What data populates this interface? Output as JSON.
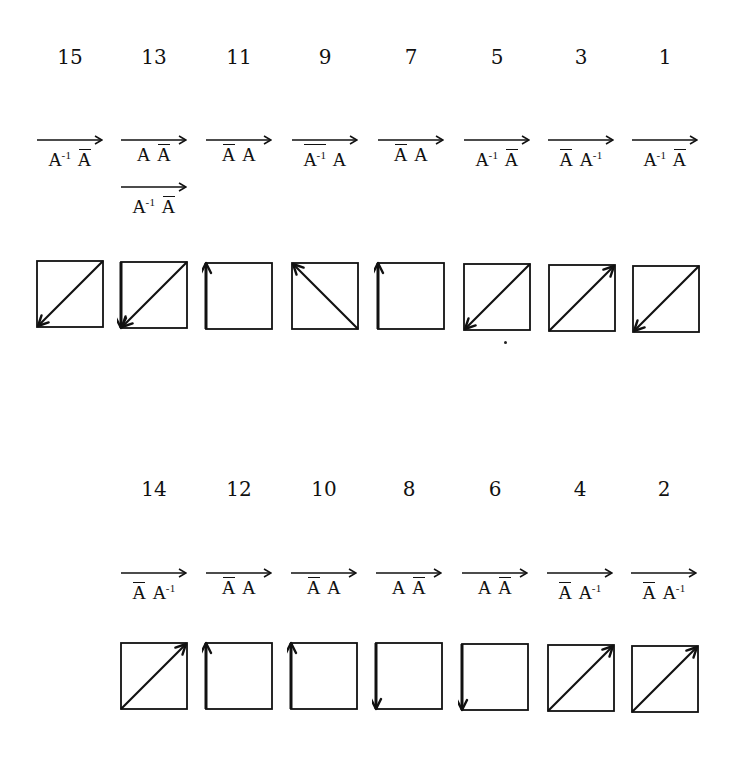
{
  "diagram": {
    "rows": [
      {
        "id": "top",
        "items": [
          {
            "number": "15",
            "labels": [
              [
                {
                  "t": "A",
                  "bar": false,
                  "sup": "-1"
                },
                {
                  "t": "A",
                  "bar": true,
                  "sup": ""
                }
              ]
            ],
            "arrow": "diag-down-left",
            "cx": 70,
            "box": {
              "x": 37,
              "y": 261,
              "s": 66
            }
          },
          {
            "number": "13",
            "labels": [
              [
                {
                  "t": "A",
                  "bar": false,
                  "sup": ""
                },
                {
                  "t": "A",
                  "bar": true,
                  "sup": ""
                }
              ],
              [
                {
                  "t": "A",
                  "bar": false,
                  "sup": "-1"
                },
                {
                  "t": "A",
                  "bar": true,
                  "sup": ""
                }
              ]
            ],
            "arrow": "diag-down-left+left-down",
            "cx": 154,
            "box": {
              "x": 121,
              "y": 262,
              "s": 66
            }
          },
          {
            "number": "11",
            "labels": [
              [
                {
                  "t": "A",
                  "bar": true,
                  "sup": ""
                },
                {
                  "t": "A",
                  "bar": false,
                  "sup": ""
                }
              ]
            ],
            "arrow": "left-up",
            "cx": 239,
            "box": {
              "x": 206,
              "y": 263,
              "s": 66
            }
          },
          {
            "number": "9",
            "labels": [
              [
                {
                  "t": "A",
                  "bar": true,
                  "sup": "-1"
                },
                {
                  "t": "A",
                  "bar": false,
                  "sup": ""
                }
              ]
            ],
            "arrow": "anti-diag-up-left",
            "cx": 325,
            "box": {
              "x": 292,
              "y": 263,
              "s": 66
            }
          },
          {
            "number": "7",
            "labels": [
              [
                {
                  "t": "A",
                  "bar": true,
                  "sup": ""
                },
                {
                  "t": "A",
                  "bar": false,
                  "sup": ""
                }
              ]
            ],
            "arrow": "left-up",
            "cx": 411,
            "box": {
              "x": 378,
              "y": 263,
              "s": 66
            }
          },
          {
            "number": "5",
            "labels": [
              [
                {
                  "t": "A",
                  "bar": false,
                  "sup": "-1"
                },
                {
                  "t": "A",
                  "bar": true,
                  "sup": ""
                }
              ]
            ],
            "arrow": "diag-down-left",
            "cx": 497,
            "box": {
              "x": 464,
              "y": 264,
              "s": 66
            }
          },
          {
            "number": "3",
            "labels": [
              [
                {
                  "t": "A",
                  "bar": true,
                  "sup": ""
                },
                {
                  "t": "A",
                  "bar": false,
                  "sup": "-1"
                }
              ]
            ],
            "arrow": "diag-up-right",
            "cx": 581,
            "box": {
              "x": 549,
              "y": 265,
              "s": 66
            }
          },
          {
            "number": "1",
            "labels": [
              [
                {
                  "t": "A",
                  "bar": false,
                  "sup": "-1"
                },
                {
                  "t": "A",
                  "bar": true,
                  "sup": ""
                }
              ]
            ],
            "arrow": "diag-down-left",
            "cx": 665,
            "box": {
              "x": 633,
              "y": 266,
              "s": 66
            }
          }
        ],
        "number_y": 45,
        "label_y": 135
      },
      {
        "id": "bottom",
        "items": [
          {
            "number": "14",
            "labels": [
              [
                {
                  "t": "A",
                  "bar": true,
                  "sup": ""
                },
                {
                  "t": "A",
                  "bar": false,
                  "sup": "-1"
                }
              ]
            ],
            "arrow": "diag-up-right",
            "cx": 154,
            "box": {
              "x": 121,
              "y": 643,
              "s": 66
            }
          },
          {
            "number": "12",
            "labels": [
              [
                {
                  "t": "A",
                  "bar": true,
                  "sup": ""
                },
                {
                  "t": "A",
                  "bar": false,
                  "sup": ""
                }
              ]
            ],
            "arrow": "left-up",
            "cx": 239,
            "box": {
              "x": 206,
              "y": 643,
              "s": 66
            }
          },
          {
            "number": "10",
            "labels": [
              [
                {
                  "t": "A",
                  "bar": true,
                  "sup": ""
                },
                {
                  "t": "A",
                  "bar": false,
                  "sup": ""
                }
              ]
            ],
            "arrow": "left-up",
            "cx": 324,
            "box": {
              "x": 291,
              "y": 643,
              "s": 66
            }
          },
          {
            "number": "8",
            "labels": [
              [
                {
                  "t": "A",
                  "bar": false,
                  "sup": ""
                },
                {
                  "t": "A",
                  "bar": true,
                  "sup": ""
                }
              ]
            ],
            "arrow": "left-down",
            "cx": 409,
            "box": {
              "x": 376,
              "y": 643,
              "s": 66
            }
          },
          {
            "number": "6",
            "labels": [
              [
                {
                  "t": "A",
                  "bar": false,
                  "sup": ""
                },
                {
                  "t": "A",
                  "bar": true,
                  "sup": ""
                }
              ]
            ],
            "arrow": "left-down",
            "cx": 495,
            "box": {
              "x": 462,
              "y": 644,
              "s": 66
            }
          },
          {
            "number": "4",
            "labels": [
              [
                {
                  "t": "A",
                  "bar": true,
                  "sup": ""
                },
                {
                  "t": "A",
                  "bar": false,
                  "sup": "-1"
                }
              ]
            ],
            "arrow": "diag-up-right",
            "cx": 580,
            "box": {
              "x": 548,
              "y": 645,
              "s": 66
            }
          },
          {
            "number": "2",
            "labels": [
              [
                {
                  "t": "A",
                  "bar": true,
                  "sup": ""
                },
                {
                  "t": "A",
                  "bar": false,
                  "sup": "-1"
                }
              ]
            ],
            "arrow": "diag-up-right",
            "cx": 664,
            "box": {
              "x": 632,
              "y": 646,
              "s": 66
            }
          }
        ],
        "number_y": 477,
        "label_y": 568
      }
    ],
    "stray_dot": {
      "x": 504,
      "y": 341
    },
    "colors": {
      "ink": "#111111",
      "background": "#ffffff"
    }
  }
}
